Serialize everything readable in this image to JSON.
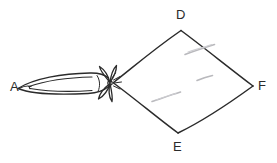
{
  "figure": {
    "background_color": "#ffffff",
    "stroke_color": "#2b2b2b",
    "faint_stroke_color": "#b9b9bd",
    "labels": [
      {
        "id": "A",
        "text": "A",
        "x": 10,
        "y": 80,
        "name": "vertex-label-a"
      },
      {
        "id": "D",
        "text": "D",
        "x": 176,
        "y": 8,
        "name": "vertex-label-d"
      },
      {
        "id": "E",
        "text": "E",
        "x": 173,
        "y": 140,
        "name": "vertex-label-e"
      },
      {
        "id": "F",
        "text": "F",
        "x": 258,
        "y": 79,
        "name": "vertex-label-f"
      }
    ],
    "quadrilateral": {
      "name": "quadrilateral-shape",
      "vertices": [
        {
          "id": "C",
          "x": 113,
          "y": 82
        },
        {
          "id": "D",
          "x": 181,
          "y": 30
        },
        {
          "id": "F",
          "x": 253,
          "y": 86
        },
        {
          "id": "E",
          "x": 178,
          "y": 133
        }
      ]
    },
    "arrow": {
      "name": "arrow-shape",
      "tip": {
        "x": 18,
        "y": 88
      },
      "nock": {
        "x": 110,
        "y": 83
      },
      "fletching_center": {
        "x": 110,
        "y": 83
      },
      "fletching_petals": 4
    },
    "smudges": [
      {
        "x1": 185,
        "y1": 54,
        "x2": 214,
        "y2": 44
      },
      {
        "x1": 197,
        "y1": 80,
        "x2": 212,
        "y2": 75
      },
      {
        "x1": 152,
        "y1": 101,
        "x2": 180,
        "y2": 92
      }
    ]
  }
}
